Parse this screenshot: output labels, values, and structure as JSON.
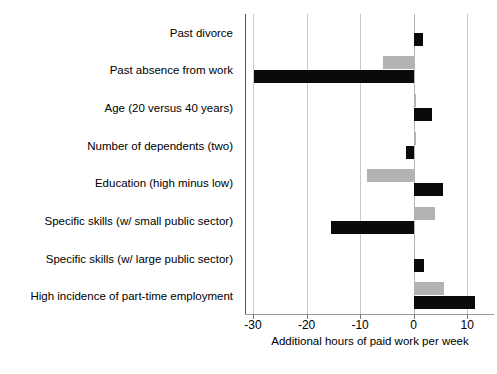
{
  "chart_data": {
    "type": "bar",
    "orientation": "horizontal",
    "title": "",
    "subtitle": "",
    "xlabel": "Additional hours of paid work per week",
    "ylabel": "",
    "xlim": [
      -31.5,
      15
    ],
    "xticks": [
      -30,
      -20,
      -10,
      0,
      10
    ],
    "xtick_labels": [
      "-30",
      "-20",
      "-10",
      "0",
      "10"
    ],
    "grid": "vertical",
    "legend": "none",
    "categories": [
      "Past divorce",
      "Past absence from work",
      "Age (20 versus 40 years)",
      "Number of dependents (two)",
      "Education (high minus low)",
      "Specific skills (w/ small public sector)",
      "Specific skills (w/ large public sector)",
      "High incidence of part-time employment"
    ],
    "series": [
      {
        "name": "series-gray",
        "color": "#b3b3b3",
        "values": [
          0.3,
          -5.8,
          0.4,
          0.4,
          -8.8,
          3.9,
          0.3,
          5.6
        ]
      },
      {
        "name": "series-black",
        "color": "#0a0a0a",
        "values": [
          1.7,
          -29.8,
          3.4,
          -1.5,
          5.4,
          -15.5,
          1.9,
          11.4
        ]
      }
    ]
  },
  "axis": {
    "zero_label": "0"
  }
}
